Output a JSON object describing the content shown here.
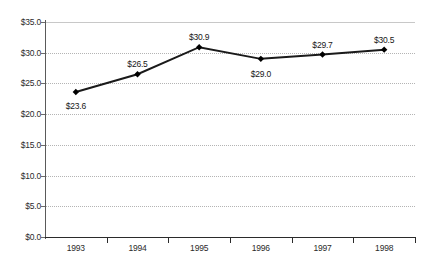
{
  "chart_data": {
    "type": "line",
    "title": "",
    "subtitle": "",
    "xlabel": "",
    "ylabel": "",
    "categories": [
      "1993",
      "1994",
      "1995",
      "1996",
      "1997",
      "1998"
    ],
    "values": [
      23.6,
      26.5,
      30.9,
      29.0,
      29.7,
      30.5
    ],
    "point_labels": [
      "$23.6",
      "$26.5",
      "$30.9",
      "$29.0",
      "$29.7",
      "$30.5"
    ],
    "series": [
      {
        "name": "",
        "values": [
          23.6,
          26.5,
          30.9,
          29.0,
          29.7,
          30.5
        ]
      }
    ],
    "ylim": [
      0.0,
      35.0
    ],
    "ytick_values": [
      35.0,
      30.0,
      25.0,
      20.0,
      15.0,
      10.0,
      5.0,
      0.0
    ],
    "ytick_labels": [
      "$35.0",
      "$30.0",
      "$25.0",
      "$20.0",
      "$15.0",
      "$10.0",
      "$5.0",
      "$0.0"
    ],
    "grid": true,
    "grid_axis": "y",
    "legend": false,
    "legend_position": "none",
    "marker": "diamond",
    "line_color": "#1a1a1a",
    "marker_color": "#000000",
    "grid_color": "#b4b4b4",
    "axis_color": "#2b2b2b",
    "text_color": "#2b2b2b",
    "background_color": "#ffffff",
    "annotations": []
  },
  "label_offsets": [
    {
      "dx": 0,
      "dy": 14
    },
    {
      "dx": 0,
      "dy": -10
    },
    {
      "dx": 0,
      "dy": -10
    },
    {
      "dx": 0,
      "dy": 15
    },
    {
      "dx": 0,
      "dy": -10
    },
    {
      "dx": 0,
      "dy": -10
    }
  ]
}
